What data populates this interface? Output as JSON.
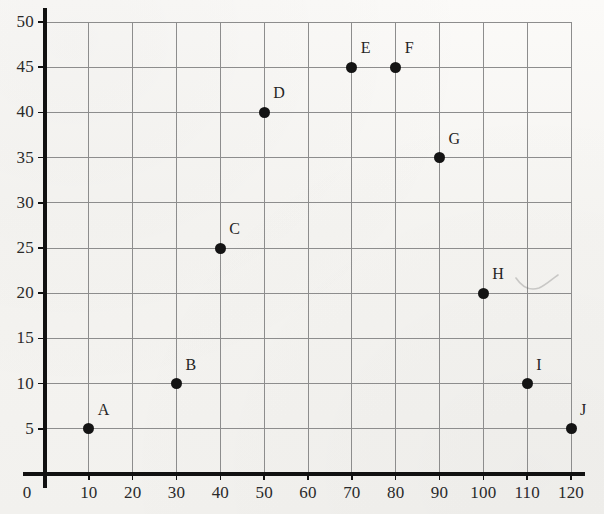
{
  "chart_data": {
    "type": "scatter",
    "title": "",
    "subtitle": "",
    "xlabel": "",
    "ylabel": "",
    "xlim": [
      0,
      120
    ],
    "ylim": [
      0,
      50
    ],
    "grid": true,
    "legend": "none",
    "x_ticks": [
      0,
      10,
      20,
      30,
      40,
      50,
      60,
      70,
      80,
      90,
      100,
      110,
      120
    ],
    "y_ticks": [
      0,
      5,
      10,
      15,
      20,
      25,
      30,
      35,
      40,
      45,
      50
    ],
    "x_tick_labels": [
      "0",
      "10",
      "20",
      "30",
      "40",
      "50",
      "60",
      "70",
      "80",
      "90",
      "100",
      "110",
      "120"
    ],
    "y_tick_labels": [
      "5",
      "10",
      "15",
      "20",
      "25",
      "30",
      "35",
      "40",
      "45",
      "50"
    ],
    "x_tick_step": 10,
    "y_tick_step": 5,
    "points": [
      {
        "label": "A",
        "x": 10,
        "y": 5
      },
      {
        "label": "B",
        "x": 30,
        "y": 10
      },
      {
        "label": "C",
        "x": 40,
        "y": 25
      },
      {
        "label": "D",
        "x": 50,
        "y": 40
      },
      {
        "label": "E",
        "x": 70,
        "y": 45
      },
      {
        "label": "F",
        "x": 80,
        "y": 45
      },
      {
        "label": "G",
        "x": 90,
        "y": 35
      },
      {
        "label": "H",
        "x": 100,
        "y": 20
      },
      {
        "label": "I",
        "x": 110,
        "y": 10
      },
      {
        "label": "J",
        "x": 120,
        "y": 5
      }
    ],
    "marker": {
      "shape": "circle",
      "filled": true,
      "color": "#141414",
      "size_px": 11
    },
    "colors": {
      "background": "#f6f5f3",
      "axis": "#111111",
      "grid": "#8d8d8d",
      "text": "#2a2a2a",
      "marker": "#141414"
    },
    "geometry": {
      "plot_left_px": 45,
      "plot_right_px": 571,
      "plot_top_px": 22,
      "plot_bottom_px": 474,
      "x_origin_px": 45,
      "y_origin_px": 474,
      "px_per_x_unit": 4.3833,
      "px_per_y_unit": 9.04
    }
  }
}
